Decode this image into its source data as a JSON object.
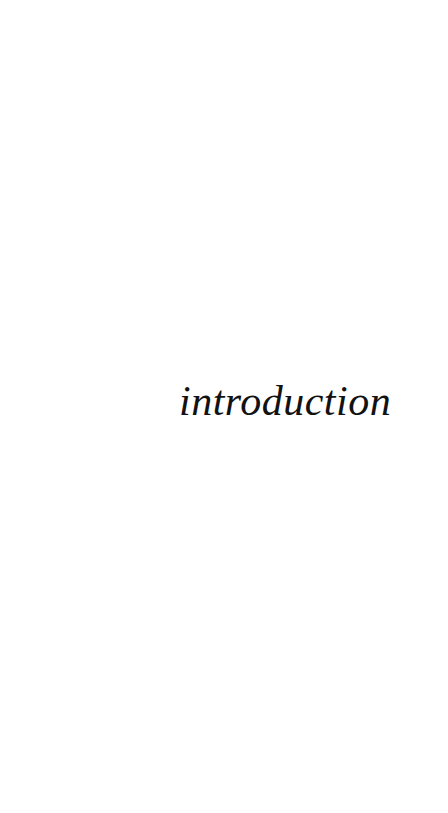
{
  "page": {
    "kind": "section-divider-page",
    "background_color": "#ffffff",
    "width": 448,
    "height": 813
  },
  "section": {
    "title": "introduction",
    "style": "lowercase-italic-serif",
    "text_color": "#121212",
    "font_size_px": 42,
    "alignment": "right-of-center",
    "baseline_y": 416
  },
  "header": {
    "running_head": ""
  },
  "footer": {
    "page_number": "",
    "folio": ""
  }
}
